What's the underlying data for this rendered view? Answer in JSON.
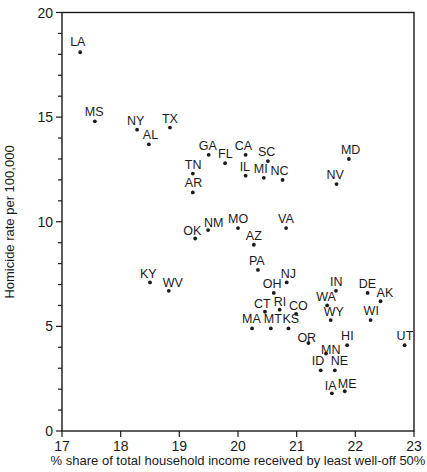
{
  "chart_data": {
    "type": "scatter",
    "title": "",
    "xlabel": "% share of total household income received by least well-off 50%",
    "ylabel": "Homicide rate per 100,000",
    "xlim": [
      17,
      23
    ],
    "ylim": [
      0,
      20
    ],
    "xticks": [
      "17",
      "18",
      "19",
      "20",
      "21",
      "22",
      "23"
    ],
    "yticks": [
      "0",
      "5",
      "10",
      "15",
      "20"
    ],
    "grid": false,
    "legend": null,
    "points": [
      {
        "label": "LA",
        "x": 17.31,
        "y": 18.1
      },
      {
        "label": "MS",
        "x": 17.56,
        "y": 14.8
      },
      {
        "label": "NY",
        "x": 18.28,
        "y": 14.4
      },
      {
        "label": "AL",
        "x": 18.48,
        "y": 13.7
      },
      {
        "label": "TX",
        "x": 18.84,
        "y": 14.5
      },
      {
        "label": "GA",
        "x": 19.5,
        "y": 13.2
      },
      {
        "label": "FL",
        "x": 19.78,
        "y": 12.8
      },
      {
        "label": "CA",
        "x": 20.13,
        "y": 13.2
      },
      {
        "label": "SC",
        "x": 20.51,
        "y": 12.9
      },
      {
        "label": "IL",
        "x": 20.13,
        "y": 12.2
      },
      {
        "label": "MI",
        "x": 20.44,
        "y": 12.1
      },
      {
        "label": "NC",
        "x": 20.76,
        "y": 12.0
      },
      {
        "label": "TN",
        "x": 19.23,
        "y": 12.3
      },
      {
        "label": "AR",
        "x": 19.23,
        "y": 11.4
      },
      {
        "label": "MD",
        "x": 21.89,
        "y": 13.0
      },
      {
        "label": "NV",
        "x": 21.68,
        "y": 11.8
      },
      {
        "label": "NM",
        "x": 19.49,
        "y": 9.6
      },
      {
        "label": "OK",
        "x": 19.27,
        "y": 9.2
      },
      {
        "label": "MO",
        "x": 20.0,
        "y": 9.7
      },
      {
        "label": "AZ",
        "x": 20.27,
        "y": 8.9
      },
      {
        "label": "VA",
        "x": 20.82,
        "y": 9.7
      },
      {
        "label": "PA",
        "x": 20.34,
        "y": 7.7
      },
      {
        "label": "NJ",
        "x": 20.83,
        "y": 7.1
      },
      {
        "label": "KY",
        "x": 18.5,
        "y": 7.1
      },
      {
        "label": "WV",
        "x": 18.82,
        "y": 6.7
      },
      {
        "label": "OH",
        "x": 20.61,
        "y": 6.6
      },
      {
        "label": "CT",
        "x": 20.46,
        "y": 5.7
      },
      {
        "label": "RI",
        "x": 20.71,
        "y": 5.8
      },
      {
        "label": "CO",
        "x": 20.99,
        "y": 5.6
      },
      {
        "label": "MA",
        "x": 20.24,
        "y": 4.9
      },
      {
        "label": "MT",
        "x": 20.56,
        "y": 4.9
      },
      {
        "label": "KS",
        "x": 20.86,
        "y": 4.9
      },
      {
        "label": "OR",
        "x": 21.2,
        "y": 4.2
      },
      {
        "label": "IN",
        "x": 21.67,
        "y": 6.7
      },
      {
        "label": "WA",
        "x": 21.52,
        "y": 6.0
      },
      {
        "label": "WY",
        "x": 21.58,
        "y": 5.3
      },
      {
        "label": "DE",
        "x": 22.21,
        "y": 6.6
      },
      {
        "label": "AK",
        "x": 22.43,
        "y": 6.2
      },
      {
        "label": "WI",
        "x": 22.26,
        "y": 5.3
      },
      {
        "label": "HI",
        "x": 21.86,
        "y": 4.1
      },
      {
        "label": "UT",
        "x": 22.84,
        "y": 4.1
      },
      {
        "label": "MN",
        "x": 21.5,
        "y": 3.7
      },
      {
        "label": "ID",
        "x": 21.41,
        "y": 2.9
      },
      {
        "label": "NE",
        "x": 21.65,
        "y": 2.9
      },
      {
        "label": "IA",
        "x": 21.6,
        "y": 1.8
      },
      {
        "label": "ME",
        "x": 21.82,
        "y": 1.9
      }
    ]
  },
  "label_offsets": {
    "LA": [
      -10,
      -6
    ],
    "MS": [
      -10,
      -5
    ],
    "NY": [
      -10,
      -5
    ],
    "AL": [
      -6,
      -5
    ],
    "TX": [
      -8,
      -5
    ],
    "GA": [
      -10,
      -5
    ],
    "FL": [
      -7,
      -5
    ],
    "CA": [
      -11,
      -5
    ],
    "SC": [
      -10,
      -5
    ],
    "IL": [
      -6,
      -5
    ],
    "MI": [
      -10,
      -5
    ],
    "NC": [
      -12,
      -5
    ],
    "TN": [
      -8,
      -5
    ],
    "AR": [
      -8,
      -5
    ],
    "MD": [
      -8,
      -5
    ],
    "NV": [
      -10,
      -5
    ],
    "NM": [
      -4,
      -3
    ],
    "OK": [
      -12,
      -3
    ],
    "MO": [
      -10,
      -5
    ],
    "AZ": [
      -8,
      -5
    ],
    "VA": [
      -8,
      -5
    ],
    "PA": [
      -9,
      -5
    ],
    "NJ": [
      -6,
      -4
    ],
    "KY": [
      -10,
      -4
    ],
    "WV": [
      -6,
      -4
    ],
    "OH": [
      -11,
      -5
    ],
    "CT": [
      -11,
      -4
    ],
    "RI": [
      -6,
      -4
    ],
    "CO": [
      -7,
      -4
    ],
    "MA": [
      -10,
      -5
    ],
    "MT": [
      -7,
      -5
    ],
    "KS": [
      -6,
      -5
    ],
    "OR": [
      -11,
      -1
    ],
    "IN": [
      -6,
      -5
    ],
    "WA": [
      -11,
      -4
    ],
    "WY": [
      -7,
      -4
    ],
    "DE": [
      -9,
      -5
    ],
    "AK": [
      -4,
      -4
    ],
    "WI": [
      -7,
      -5
    ],
    "HI": [
      -6,
      -5
    ],
    "UT": [
      -8,
      -5
    ],
    "MN": [
      -5,
      0
    ],
    "ID": [
      -9,
      -5
    ],
    "NE": [
      -4,
      -5
    ],
    "IA": [
      -7,
      -3
    ],
    "ME": [
      -7,
      -3
    ]
  },
  "colors": {
    "ink": "#1a1a1a",
    "background": "#ffffff"
  }
}
